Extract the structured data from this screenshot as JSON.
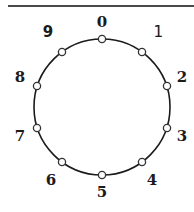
{
  "figure": {
    "title": "",
    "divider": {
      "name": "horizontal-rule",
      "color": "#4a4a4a"
    },
    "colors": {
      "stroke": "#1b1b1b",
      "node_fill": "#ffffff",
      "node_stroke": "#333333",
      "label": "#1b1b1b",
      "rule": "#4a4a4a",
      "background": "#ffffff"
    }
  },
  "chart_data": {
    "type": "scatter",
    "title": "",
    "subtitle": "",
    "xlabel": "",
    "ylabel": "",
    "legend": [],
    "grid": false,
    "shape": "circle",
    "center": {
      "x": 102,
      "y": 107
    },
    "radius": 68,
    "node_count": 10,
    "direction": "clockwise",
    "start_angle_deg": -90,
    "categories": [
      "0",
      "1",
      "2",
      "3",
      "4",
      "5",
      "6",
      "7",
      "8",
      "9"
    ],
    "values": [
      0,
      1,
      2,
      3,
      4,
      5,
      6,
      7,
      8,
      9
    ],
    "nodes": [
      {
        "label": "0",
        "angle_deg": -90,
        "cx": 102,
        "cy": 39,
        "lx": 102,
        "ly": 22
      },
      {
        "label": "1",
        "angle_deg": -54,
        "cx": 142,
        "cy": 52,
        "lx": 158,
        "ly": 32
      },
      {
        "label": "2",
        "angle_deg": -18,
        "cx": 167,
        "cy": 86,
        "lx": 182,
        "ly": 77
      },
      {
        "label": "3",
        "angle_deg": 18,
        "cx": 167,
        "cy": 128,
        "lx": 182,
        "ly": 136
      },
      {
        "label": "4",
        "angle_deg": 54,
        "cx": 142,
        "cy": 162,
        "lx": 152,
        "ly": 180
      },
      {
        "label": "5",
        "angle_deg": 90,
        "cx": 102,
        "cy": 175,
        "lx": 102,
        "ly": 192
      },
      {
        "label": "6",
        "angle_deg": 126,
        "cx": 62,
        "cy": 162,
        "lx": 51,
        "ly": 180
      },
      {
        "label": "7",
        "angle_deg": 162,
        "cx": 37,
        "cy": 128,
        "lx": 20,
        "ly": 136
      },
      {
        "label": "8",
        "angle_deg": 198,
        "cx": 37,
        "cy": 86,
        "lx": 20,
        "ly": 77
      },
      {
        "label": "9",
        "angle_deg": 234,
        "cx": 62,
        "cy": 52,
        "lx": 48,
        "ly": 32
      }
    ]
  }
}
